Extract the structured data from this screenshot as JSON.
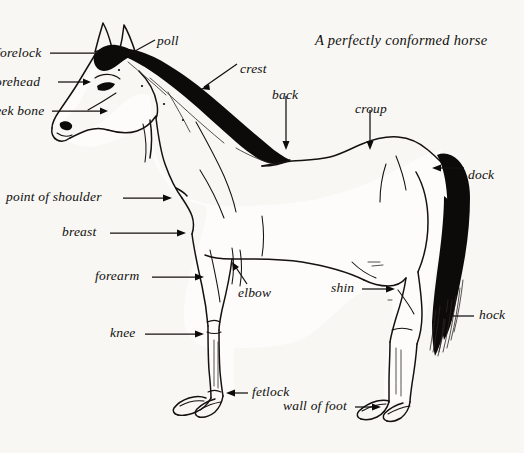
{
  "figure": {
    "title": "A perfectly conformed horse",
    "subject": "horse",
    "style": "pen-and-ink line drawing",
    "background_color": "#f8f7f4",
    "ink_color": "#14110f",
    "width": 524,
    "height": 453
  },
  "labels": [
    {
      "id": "poll",
      "text": "poll",
      "x": 157,
      "y": 34,
      "align": "left",
      "clipped": false
    },
    {
      "id": "forelock",
      "text": "forelock",
      "x": -4,
      "y": 57,
      "align": "left",
      "clipped": true
    },
    {
      "id": "forehead",
      "text": "forehead",
      "x": -9,
      "y": 86,
      "align": "left",
      "clipped": true
    },
    {
      "id": "cheek-bone",
      "text": "cheek bone",
      "x": -18,
      "y": 114,
      "align": "left",
      "clipped": true
    },
    {
      "id": "crest",
      "text": "crest",
      "x": 240,
      "y": 63,
      "align": "left",
      "clipped": false
    },
    {
      "id": "back",
      "text": "back",
      "x": 276,
      "y": 91,
      "align": "left",
      "clipped": false
    },
    {
      "id": "croup",
      "text": "croup",
      "x": 357,
      "y": 104,
      "align": "left",
      "clipped": false
    },
    {
      "id": "dock",
      "text": "dock",
      "x": 468,
      "y": 170,
      "align": "left",
      "clipped": false
    },
    {
      "id": "point-of-shoulder",
      "text": "point of shoulder",
      "x": 6,
      "y": 195,
      "align": "left",
      "clipped": false
    },
    {
      "id": "breast",
      "text": "breast",
      "x": 62,
      "y": 230,
      "align": "left",
      "clipped": false
    },
    {
      "id": "forearm",
      "text": "forearm",
      "x": 95,
      "y": 274,
      "align": "left",
      "clipped": false
    },
    {
      "id": "elbow",
      "text": "elbow",
      "x": 238,
      "y": 288,
      "align": "left",
      "clipped": false
    },
    {
      "id": "shin",
      "text": "shin",
      "x": 333,
      "y": 286,
      "align": "left",
      "clipped": false
    },
    {
      "id": "hock",
      "text": "hock",
      "x": 479,
      "y": 310,
      "align": "left",
      "clipped": false
    },
    {
      "id": "knee",
      "text": "knee",
      "x": 110,
      "y": 331,
      "align": "left",
      "clipped": false
    },
    {
      "id": "fetlock",
      "text": "fetlock",
      "x": 252,
      "y": 389,
      "align": "left",
      "clipped": false
    },
    {
      "id": "wall-of-foot",
      "text": "wall of foot",
      "x": 283,
      "y": 403,
      "align": "left",
      "clipped": false
    }
  ],
  "anatomy_parts": [
    "poll",
    "forelock",
    "forehead",
    "cheek bone",
    "crest",
    "back",
    "croup",
    "dock",
    "point of shoulder",
    "breast",
    "forearm",
    "elbow",
    "shin",
    "hock",
    "knee",
    "fetlock",
    "wall of foot"
  ]
}
